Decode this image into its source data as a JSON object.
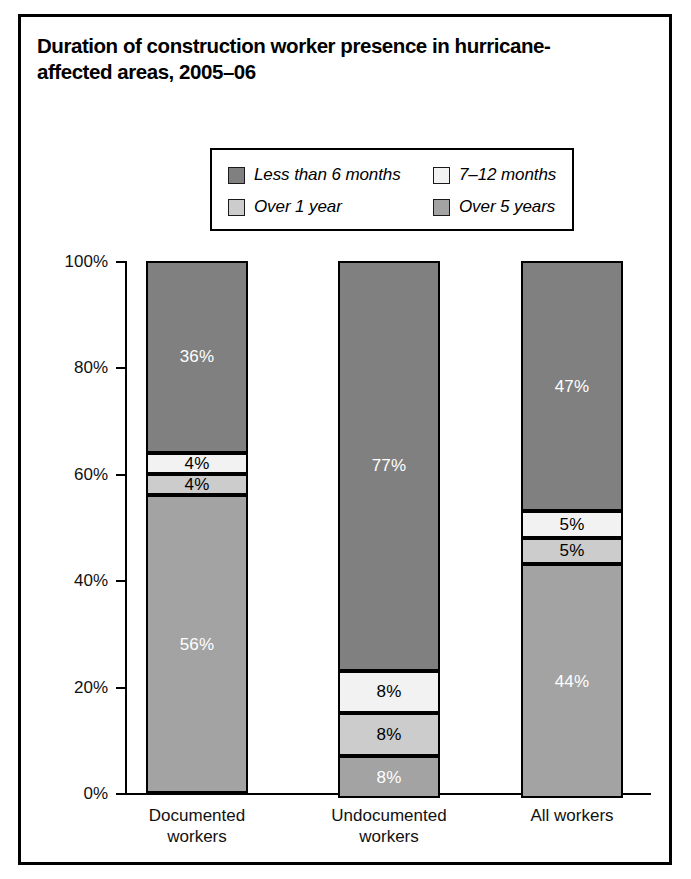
{
  "title": {
    "line1": "Duration of construction worker presence in hurricane-",
    "line2": "affected areas, 2005–06"
  },
  "legend": {
    "items": [
      {
        "label": "Less than 6 months",
        "color": "#808080"
      },
      {
        "label": "7–12 months",
        "color": "#f2f2f2"
      },
      {
        "label": "Over 1 year",
        "color": "#cccccc"
      },
      {
        "label": "Over 5 years",
        "color": "#a3a3a3"
      }
    ]
  },
  "chart_data": {
    "type": "bar",
    "subtype": "stacked-100-percent",
    "xlabel": "",
    "ylabel": "",
    "ylim": [
      0,
      100
    ],
    "ytick_labels": [
      "0%",
      "20%",
      "40%",
      "60%",
      "80%",
      "100%"
    ],
    "ytick_values": [
      0,
      20,
      40,
      60,
      80,
      100
    ],
    "grid": false,
    "legend_position": "top-center",
    "categories": [
      "Documented workers",
      "Undocumented workers",
      "All workers"
    ],
    "category_lines": [
      [
        "Documented",
        "workers"
      ],
      [
        "Undocumented",
        "workers"
      ],
      [
        "All workers",
        ""
      ]
    ],
    "series": [
      {
        "name": "Less than 6 months",
        "color": "#808080",
        "text_color": "#ffffff",
        "values": [
          36,
          77,
          47
        ],
        "labels": [
          "36%",
          "77%",
          "47%"
        ]
      },
      {
        "name": "7–12 months",
        "color": "#f2f2f2",
        "text_color": "#000000",
        "values": [
          4,
          8,
          5
        ],
        "labels": [
          "4%",
          "8%",
          "5%"
        ]
      },
      {
        "name": "Over 1 year",
        "color": "#cccccc",
        "text_color": "#000000",
        "values": [
          4,
          8,
          5
        ],
        "labels": [
          "4%",
          "8%",
          "5%"
        ]
      },
      {
        "name": "Over 5 years",
        "color": "#a3a3a3",
        "text_color": "#ffffff",
        "values": [
          56,
          8,
          44
        ],
        "labels": [
          "56%",
          "8%",
          "44%"
        ]
      }
    ]
  },
  "geometry": {
    "axis_top_y": 244,
    "axis_bottom_y": 776,
    "axis_x": 104,
    "axis_right_x": 630,
    "bar_width": 102,
    "bar_centers": [
      176,
      368,
      551
    ],
    "tick_len": 9
  }
}
